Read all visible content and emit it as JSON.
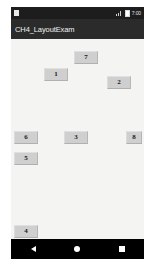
{
  "window": {
    "platform": "android",
    "app_title": "CH4_LayoutExam"
  },
  "status_bar": {
    "notification_icon": "notification-square-icon",
    "signal_icon": "signal-bars-icon",
    "battery_icon": "battery-icon",
    "time": "7:00"
  },
  "content": {
    "background_color": "#f4f4f2",
    "button_color": "#cfcfcf",
    "buttons": [
      {
        "label": "7",
        "name": "button-7",
        "x": 63,
        "y": 12,
        "w": 24,
        "h": 13
      },
      {
        "label": "1",
        "name": "button-1",
        "x": 33,
        "y": 29,
        "w": 24,
        "h": 13
      },
      {
        "label": "2",
        "name": "button-2",
        "x": 96,
        "y": 37,
        "w": 24,
        "h": 13
      },
      {
        "label": "6",
        "name": "button-6",
        "x": 3,
        "y": 92,
        "w": 24,
        "h": 13
      },
      {
        "label": "3",
        "name": "button-3",
        "x": 53,
        "y": 92,
        "w": 24,
        "h": 13
      },
      {
        "label": "8",
        "name": "button-8",
        "x": 115,
        "y": 92,
        "w": 16,
        "h": 13
      },
      {
        "label": "5",
        "name": "button-5",
        "x": 3,
        "y": 113,
        "w": 24,
        "h": 13
      },
      {
        "label": "4",
        "name": "button-4",
        "x": 3,
        "y": 186,
        "w": 24,
        "h": 13
      }
    ]
  },
  "nav_bar": {
    "back_icon": "triangle-back-icon",
    "home_icon": "circle-home-icon",
    "recents_icon": "square-recents-icon"
  }
}
